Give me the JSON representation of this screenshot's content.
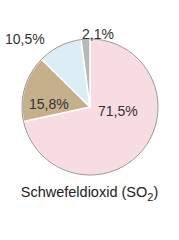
{
  "chart_data": {
    "type": "pie",
    "title": "Schwefeldioxid (SO2)",
    "title_main": "Schwefeldioxid (SO",
    "title_sub": "2",
    "title_end": ")",
    "slices": [
      {
        "label": "71,5%",
        "value": 71.5,
        "color": "#f7dde2"
      },
      {
        "label": "15,8%",
        "value": 15.8,
        "color": "#c6b08a"
      },
      {
        "label": "10,5%",
        "value": 10.5,
        "color": "#dcedf5"
      },
      {
        "label": "2,1%",
        "value": 2.1,
        "color": "#b8b8b8"
      }
    ],
    "legend": "none"
  }
}
